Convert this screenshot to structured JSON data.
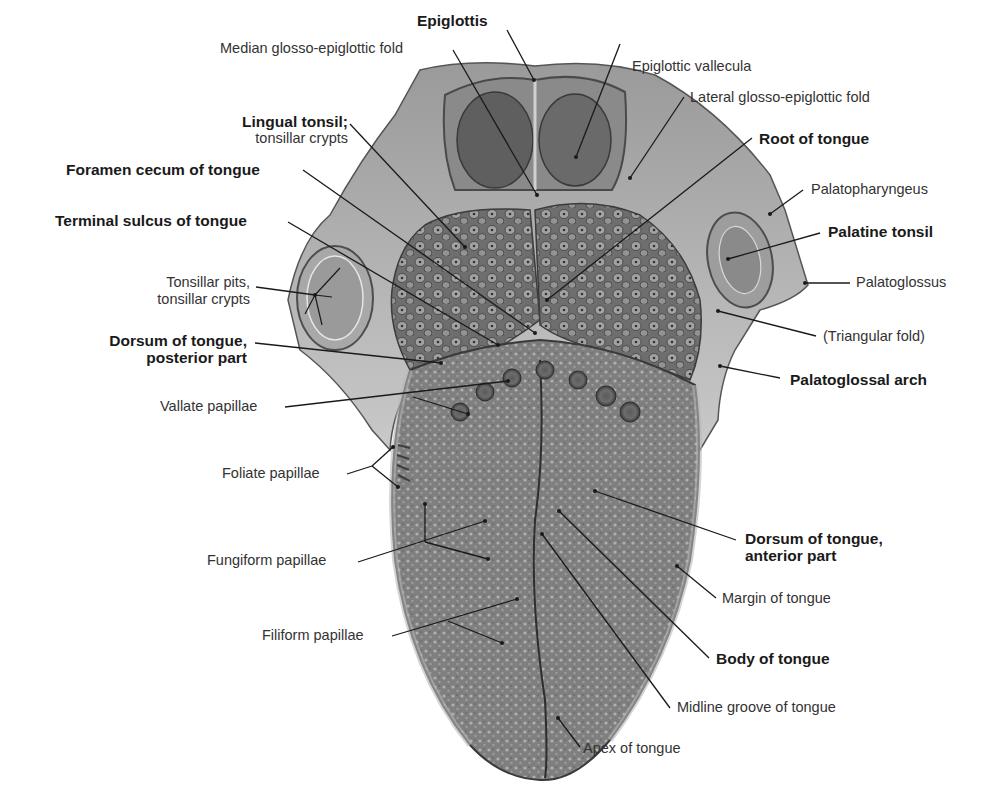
{
  "figure": {
    "colors": {
      "background": "#ffffff",
      "tissue_dark": "#5a5a5a",
      "tissue_mid": "#8c8c8c",
      "tissue_light": "#c4c4c4",
      "leader_line": "#1a1a1a",
      "label_text": "#333333"
    }
  },
  "labels": {
    "epiglottis": "Epiglottis",
    "median_fold": "Median glosso-epiglottic fold",
    "epiglottic_vallecula": "Epiglottic vallecula",
    "lateral_fold": "Lateral glosso-epiglottic fold",
    "lingual_tonsil_1": "Lingual tonsil;",
    "lingual_tonsil_2": "tonsillar crypts",
    "root_of_tongue": "Root of tongue",
    "foramen_cecum": "Foramen cecum of tongue",
    "terminal_sulcus": "Terminal sulcus of tongue",
    "palatopharyngeus": "Palatopharyngeus",
    "palatine_tonsil": "Palatine tonsil",
    "tonsillar_pits_1": "Tonsillar pits,",
    "tonsillar_pits_2": "tonsillar crypts",
    "palatoglossus": "Palatoglossus",
    "dorsum_posterior_1": "Dorsum of tongue,",
    "dorsum_posterior_2": "posterior part",
    "triangular_fold": "(Triangular fold)",
    "palatoglossal_arch": "Palatoglossal arch",
    "vallate_papillae": "Vallate papillae",
    "foliate_papillae": "Foliate papillae",
    "dorsum_anterior_1": "Dorsum of tongue,",
    "dorsum_anterior_2": "anterior part",
    "fungiform_papillae": "Fungiform papillae",
    "margin_of_tongue": "Margin of tongue",
    "filiform_papillae": "Filiform papillae",
    "body_of_tongue": "Body of tongue",
    "midline_groove": "Midline groove of tongue",
    "apex_of_tongue": "Apex of tongue"
  }
}
